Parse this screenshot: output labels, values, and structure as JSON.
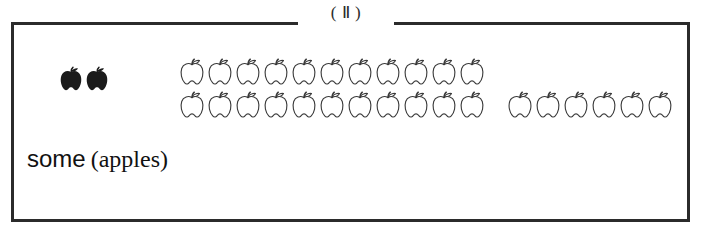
{
  "figure": {
    "caption": "( Ⅱ )",
    "caption_label": "roman-numeral-two",
    "border_color": "#2b2b2b",
    "background_color": "#ffffff"
  },
  "label": {
    "quantifier": "some",
    "noun": "(apples)",
    "full_text": "some (apples)"
  },
  "icons": {
    "apple_outline_name": "apple-outline-icon",
    "apple_filled_name": "apple-filled-icon",
    "outline_color": "#3a3a3a",
    "fill_color": "#1b1b1b"
  },
  "groups": [
    {
      "id": "black-apple-group",
      "name": "filled-apple-set",
      "style": "filled",
      "rows": [
        {
          "count": 2
        }
      ],
      "total": 2
    },
    {
      "id": "main-apple-block",
      "name": "outlined-apple-block",
      "style": "outline",
      "rows": [
        {
          "count": 11
        },
        {
          "count": 11
        }
      ],
      "total": 22
    },
    {
      "id": "side-apple-group",
      "name": "outlined-apple-remainder",
      "style": "outline",
      "rows": [
        {
          "count": 6
        }
      ],
      "total": 6
    }
  ],
  "counts": {
    "filled_apples": 2,
    "outlined_block_apples": 22,
    "outlined_side_apples": 6,
    "total_outlined": 28,
    "total_apples": 30
  }
}
